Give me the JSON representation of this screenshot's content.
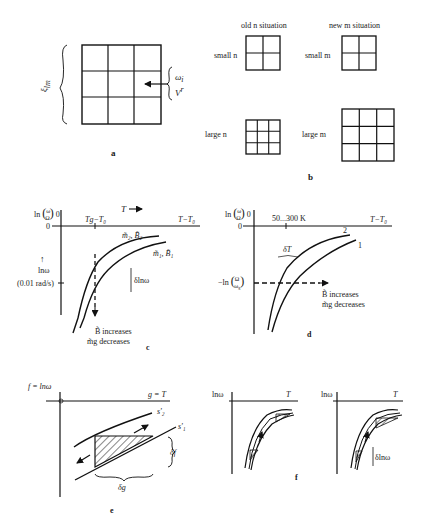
{
  "panel_a": {
    "label": "a",
    "xi_label": "ξ",
    "xi_sub": "lm",
    "omega_label": "ω",
    "omega_sub": "i",
    "v_label": "V",
    "v_sup": "r",
    "v_sub": "i",
    "grid": {
      "rows": 3,
      "cols": 3
    }
  },
  "panel_b": {
    "label": "b",
    "col_old": "old n situation",
    "col_new": "new m situation",
    "row_small_n": "small n",
    "row_large_n": "large n",
    "row_small_m": "small m",
    "row_large_m": "large m"
  },
  "panel_c": {
    "label": "c",
    "ylabel": "ln (ω/Ω) 0",
    "y_zero": "0",
    "x_arrow_label": "T",
    "x_end_label": "T−T₀",
    "x_tick_label": "Tg−T₀",
    "curve_upper": "m̃₂, B̃₂",
    "curve_lower": "m̃₁, B̃₁",
    "lnw_label": "lnω",
    "y_tick_label": "(0.01 rad/s)",
    "delta_label": "δlnω",
    "note_line1": "B̃  increases",
    "note_line2": "m̃g decreases"
  },
  "panel_d": {
    "label": "d",
    "ylabel": "ln (ω/Ω) 0",
    "y_zero": "0",
    "x_tick_label": "50...300 K",
    "x_end_label": "T−T₀",
    "curve_upper": "2",
    "curve_lower": "1",
    "delta_label": "δT",
    "y_tick_label": "−ln (Ω/ωg)",
    "note_line1": "B̃  increases",
    "note_line2": "m̃g decreases"
  },
  "panel_e": {
    "label": "e",
    "ylabel": "f = lnω",
    "xlabel": "g = T",
    "curve_upper": "s'₂",
    "curve_lower": "s'₁",
    "delta_f": "δf",
    "delta_g": "δg"
  },
  "panel_f": {
    "label": "f",
    "left": {
      "ylabel": "lnω",
      "xlabel": "T"
    },
    "right": {
      "ylabel": "lnω",
      "xlabel": "T",
      "delta_label": "δlnω"
    }
  }
}
